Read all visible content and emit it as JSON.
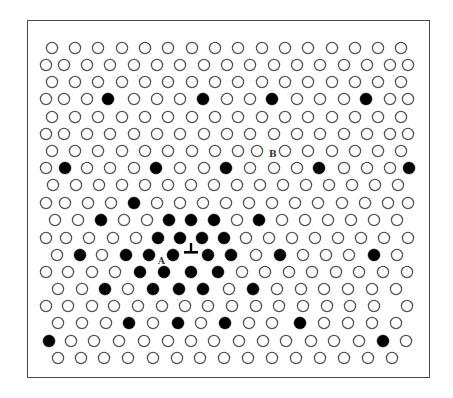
{
  "figure": {
    "type": "crystal-lattice-dislocation-diagram",
    "frame": {
      "x": 27,
      "y": 20,
      "width": 403,
      "height": 358,
      "border_color": "#4a4a4a"
    },
    "atom_radius": 5.6,
    "colors": {
      "open_stroke": "#555555",
      "filled": "#000000",
      "background": "#ffffff"
    },
    "labels": [
      {
        "text": "A",
        "x": 157,
        "y": 256
      },
      {
        "text": "B",
        "x": 268,
        "y": 149
      }
    ],
    "dislocation_symbol": {
      "glyph": "⊥",
      "x": 190,
      "y": 248,
      "meaning": "edge-dislocation"
    },
    "rows": [
      {
        "y": 47,
        "xs": [
          51,
          74,
          97,
          121,
          144,
          167,
          191,
          214,
          237,
          261,
          284,
          307,
          331,
          354,
          377,
          400
        ],
        "filled": []
      },
      {
        "y": 64,
        "xs": [
          45,
          63,
          86,
          109,
          133,
          156,
          179,
          203,
          226,
          249,
          273,
          296,
          319,
          343,
          366,
          389,
          407
        ],
        "filled": []
      },
      {
        "y": 81,
        "xs": [
          51,
          74,
          97,
          121,
          144,
          167,
          191,
          214,
          237,
          261,
          284,
          307,
          331,
          354,
          377,
          400
        ],
        "filled": []
      },
      {
        "y": 98,
        "xs": [
          45,
          63,
          86,
          107,
          133,
          156,
          179,
          202,
          226,
          249,
          271,
          296,
          319,
          343,
          365,
          389,
          407
        ],
        "filled": [
          107,
          202,
          271,
          365
        ]
      },
      {
        "y": 116,
        "xs": [
          51,
          74,
          97,
          121,
          144,
          167,
          191,
          214,
          237,
          261,
          284,
          307,
          331,
          354,
          377,
          400
        ],
        "filled": []
      },
      {
        "y": 133,
        "xs": [
          45,
          63,
          86,
          109,
          133,
          156,
          179,
          203,
          226,
          249,
          273,
          296,
          319,
          343,
          366,
          389,
          407
        ],
        "filled": []
      },
      {
        "y": 150,
        "xs": [
          51,
          74,
          97,
          121,
          144,
          167,
          191,
          214,
          237,
          256,
          284,
          307,
          331,
          354,
          377,
          400
        ],
        "filled": []
      },
      {
        "y": 167,
        "xs": [
          45,
          64,
          86,
          109,
          133,
          155,
          179,
          203,
          225,
          249,
          273,
          296,
          318,
          343,
          366,
          389,
          408
        ],
        "filled": [
          64,
          155,
          225,
          318,
          408
        ]
      },
      {
        "y": 184,
        "xs": [
          52,
          75,
          98,
          121,
          144,
          167,
          190,
          213,
          236,
          259,
          282,
          305,
          328,
          351,
          374,
          397
        ],
        "filled": []
      },
      {
        "y": 202,
        "xs": [
          45,
          64,
          87,
          110,
          133,
          156,
          179,
          202,
          225,
          248,
          271,
          294,
          317,
          341,
          364,
          387,
          407
        ],
        "filled": [
          133
        ]
      },
      {
        "y": 219,
        "xs": [
          54,
          77,
          100,
          123,
          146,
          168,
          190,
          213,
          236,
          258,
          281,
          304,
          327,
          350,
          373,
          396
        ],
        "filled": [
          100,
          168,
          190,
          213,
          258
        ]
      },
      {
        "y": 237,
        "xs": [
          45,
          65,
          88,
          112,
          135,
          157,
          179,
          201,
          223,
          245,
          268,
          291,
          314,
          337,
          360,
          383,
          407
        ],
        "filled": [
          157,
          179,
          201,
          223
        ]
      },
      {
        "y": 254,
        "xs": [
          56,
          79,
          101,
          125,
          148,
          172,
          207,
          230,
          255,
          279,
          302,
          325,
          348,
          373,
          396
        ],
        "filled": [
          79,
          125,
          148,
          172,
          207,
          230,
          279,
          373
        ]
      },
      {
        "y": 271,
        "xs": [
          45,
          67,
          91,
          114,
          139,
          163,
          190,
          217,
          241,
          264,
          288,
          311,
          335,
          358,
          382,
          406
        ],
        "filled": [
          139,
          163,
          190,
          217
        ]
      },
      {
        "y": 288,
        "xs": [
          57,
          81,
          104,
          127,
          152,
          178,
          202,
          228,
          252,
          276,
          300,
          323,
          347,
          371,
          395
        ],
        "filled": [
          104,
          152,
          178,
          202,
          252
        ]
      },
      {
        "y": 305,
        "xs": [
          45,
          67,
          91,
          113,
          137,
          161,
          184,
          207,
          231,
          255,
          278,
          302,
          326,
          349,
          373,
          406
        ],
        "filled": []
      },
      {
        "y": 322,
        "xs": [
          57,
          81,
          105,
          128,
          152,
          177,
          200,
          224,
          248,
          271,
          299,
          323,
          347,
          371,
          395
        ],
        "filled": [
          128,
          177,
          224,
          299
        ]
      },
      {
        "y": 340,
        "xs": [
          48,
          70,
          93,
          118,
          143,
          167,
          190,
          213,
          238,
          262,
          285,
          310,
          333,
          358,
          382,
          405
        ],
        "filled": [
          48,
          382
        ]
      },
      {
        "y": 357,
        "xs": [
          57,
          80,
          103,
          127,
          152,
          176,
          199,
          223,
          247,
          271,
          295,
          319,
          343,
          367,
          391
        ],
        "filled": []
      }
    ]
  }
}
